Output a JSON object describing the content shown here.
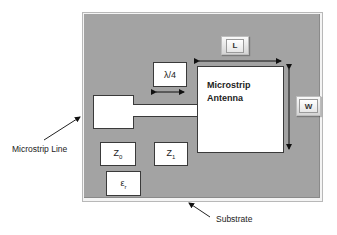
{
  "diagram": {
    "colors": {
      "substrate": "#a3a3a3",
      "element_fill": "#ffffff",
      "element_border": "#3a3a3a",
      "arrow": "#111111"
    },
    "antenna": {
      "label_line1": "Microstrip",
      "label_line2": "Antenna"
    },
    "quarter_wave": {
      "label": "λ/4"
    },
    "length_button": {
      "label": "L"
    },
    "width_button": {
      "label": "W"
    },
    "impedance_z0": {
      "label": "Z",
      "subscript": "0"
    },
    "impedance_z1": {
      "label": "Z",
      "subscript": "1"
    },
    "permittivity": {
      "label": "ε",
      "subscript": "r"
    },
    "callouts": {
      "microstrip_line": "Microstrip Line",
      "substrate": "Substrate"
    }
  }
}
